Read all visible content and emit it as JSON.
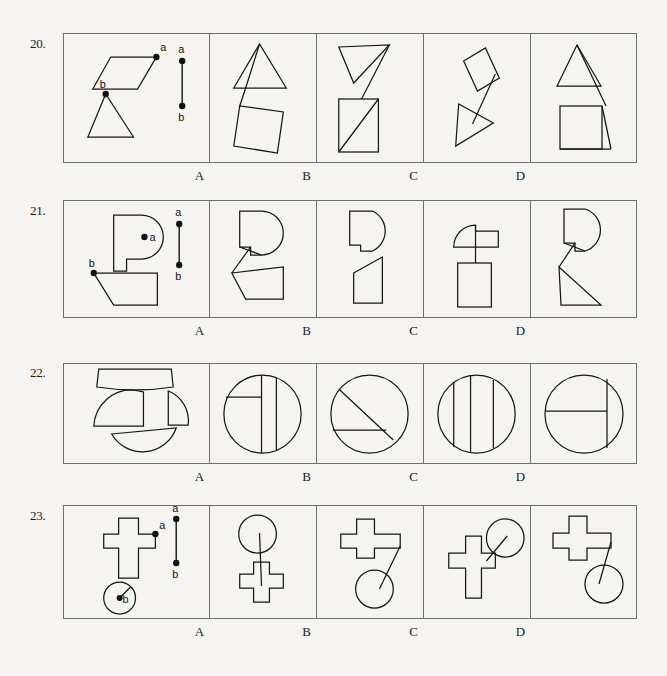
{
  "page": {
    "background_color": "#f6f4f0",
    "ink_color": "#161616",
    "border_color": "#6f6f6f",
    "type": "spatial-reasoning-assembly-test"
  },
  "option_labels": [
    "A",
    "B",
    "C",
    "D"
  ],
  "questions": [
    {
      "number": "20.",
      "prompt_panel": {
        "name": "question-20-prompt",
        "description": "parallelogram with point a and triangle with point b, plus reference segment a-b",
        "point_labels": [
          "a",
          "b"
        ],
        "reference_labels": [
          "a",
          "b"
        ]
      },
      "options": [
        {
          "label": "A",
          "name": "question-20-option-a",
          "description": "triangle above parallelogram joined by long segment"
        },
        {
          "label": "B",
          "name": "question-20-option-b",
          "description": "inverted triangle above rectangle with diagonal"
        },
        {
          "label": "C",
          "name": "question-20-option-c",
          "description": "parallelogram above right-pointing triangle"
        },
        {
          "label": "D",
          "name": "question-20-option-d",
          "description": "triangle above square connected at vertex"
        }
      ]
    },
    {
      "number": "21.",
      "prompt_panel": {
        "name": "question-21-prompt",
        "description": "P-shape with point a and trapezoid with point b, plus reference segment a-b",
        "point_labels": [
          "a",
          "b"
        ],
        "reference_labels": [
          "a",
          "b"
        ]
      },
      "options": [
        {
          "label": "A",
          "name": "question-21-option-a",
          "description": "P-shape joined to trapezoid by zigzag"
        },
        {
          "label": "B",
          "name": "question-21-option-b",
          "description": "P-shape above angled trapezoid, single outline"
        },
        {
          "label": "C",
          "name": "question-21-option-c",
          "description": "rounded shape above rectangle joined by vertical line"
        },
        {
          "label": "D",
          "name": "question-21-option-d",
          "description": "rounded shape above triangle joined by zigzag"
        }
      ]
    },
    {
      "number": "22.",
      "prompt_panel": {
        "name": "question-22-prompt",
        "description": "four circle segments: top arc band, large domed piece, small quarter wedge, half-lens piece",
        "point_labels": [],
        "reference_labels": []
      },
      "options": [
        {
          "label": "A",
          "name": "question-22-option-a",
          "description": "circle with vertical chord and horizontal chord forming cross"
        },
        {
          "label": "B",
          "name": "question-22-option-b",
          "description": "circle with diagonal chord and horizontal chord"
        },
        {
          "label": "C",
          "name": "question-22-option-c",
          "description": "circle with three vertical chords"
        },
        {
          "label": "D",
          "name": "question-22-option-d",
          "description": "circle with horizontal chord and vertical chord on right"
        }
      ]
    },
    {
      "number": "23.",
      "prompt_panel": {
        "name": "question-23-prompt",
        "description": "cross shape with point a and circle with point b, plus reference segment a-b",
        "point_labels": [
          "a",
          "b"
        ],
        "reference_labels": [
          "a",
          "b"
        ]
      },
      "options": [
        {
          "label": "A",
          "name": "question-23-option-a",
          "description": "circle above cross connected by long line"
        },
        {
          "label": "B",
          "name": "question-23-option-b",
          "description": "wide cross above circle connected by line"
        },
        {
          "label": "C",
          "name": "question-23-option-c",
          "description": "cross with circle at upper right"
        },
        {
          "label": "D",
          "name": "question-23-option-d",
          "description": "wide cross with circle at lower right"
        }
      ]
    }
  ]
}
